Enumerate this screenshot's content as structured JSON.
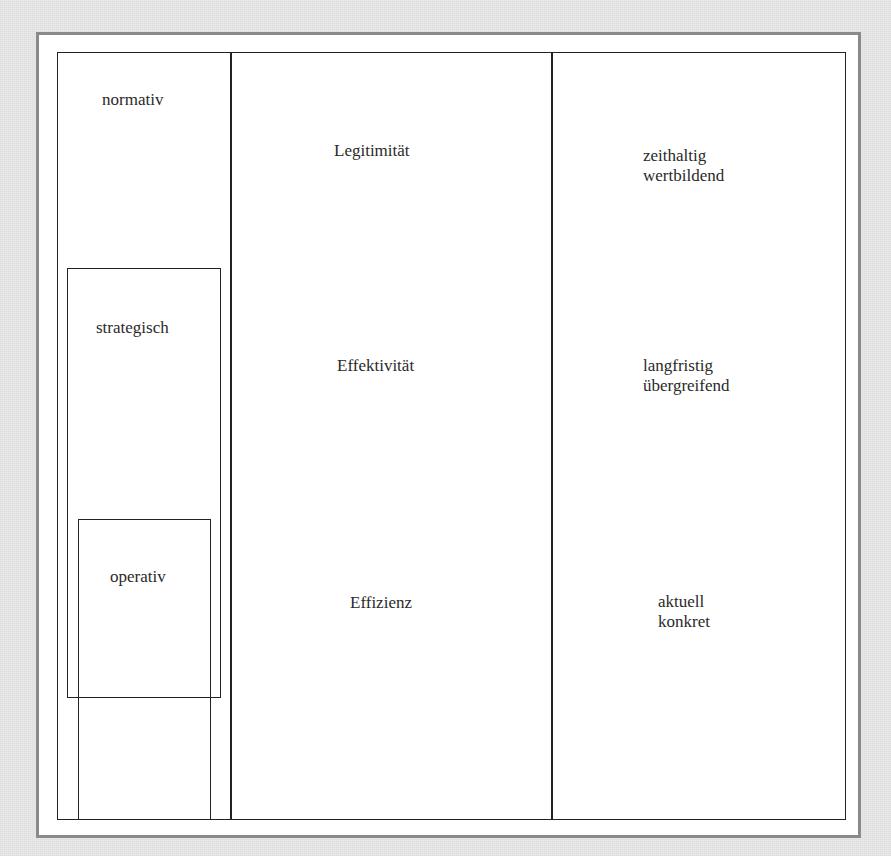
{
  "diagram": {
    "levels": {
      "normativ": "normativ",
      "strategisch": "strategisch",
      "operativ": "operativ"
    },
    "criteria": {
      "legitimitaet": "Legitimität",
      "effektivitaet": "Effektivität",
      "effizienz": "Effizienz"
    },
    "characteristics": {
      "normativ": {
        "line1": "zeithaltig",
        "line2": "wertbildend"
      },
      "strategisch": {
        "line1": "langfristig",
        "line2": "übergreifend"
      },
      "operativ": {
        "line1": "aktuell",
        "line2": "konkret"
      }
    },
    "colors": {
      "background": "#e9e9e9",
      "outer_border": "#8a8a8a",
      "lines": "#222222",
      "text": "#2a2a2a"
    }
  }
}
